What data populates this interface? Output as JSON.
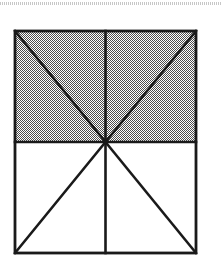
{
  "page": {
    "width": 221,
    "height": 275,
    "background_color": "#ffffff",
    "artifact": {
      "name": "scan-line-band",
      "y": 2,
      "height": 3,
      "color": "#787878"
    }
  },
  "figure": {
    "title": "Rectangle divided into eight triangles by two diagonals and a vertical median",
    "shape_type": "diagram",
    "stroke_color": "#1a1a1a",
    "stroke_width": 2.6,
    "fill_shaded": "#808080",
    "fill_plain": "#ffffff",
    "rect": {
      "left": 15,
      "top": 31,
      "right": 196,
      "bottom": 253,
      "width": 181,
      "height": 222
    },
    "center_point": {
      "x": 105.5,
      "y": 142,
      "label": "centre"
    },
    "corners": [
      {
        "name": "top-left",
        "x": 15,
        "y": 31
      },
      {
        "name": "top-right",
        "x": 196,
        "y": 31
      },
      {
        "name": "bottom-right",
        "x": 196,
        "y": 253
      },
      {
        "name": "bottom-left",
        "x": 15,
        "y": 253
      }
    ],
    "regions": [
      {
        "name": "upper-left-triangle",
        "shaded": true,
        "fill": "#808080"
      },
      {
        "name": "upper-right-triangle",
        "shaded": true,
        "fill": "#808080"
      },
      {
        "name": "left-upper-wedge",
        "shaded": true,
        "fill": "#808080"
      },
      {
        "name": "right-upper-wedge",
        "shaded": true,
        "fill": "#808080"
      },
      {
        "name": "lower-left-triangle",
        "shaded": false,
        "fill": "#ffffff"
      },
      {
        "name": "lower-right-triangle",
        "shaded": false,
        "fill": "#ffffff"
      },
      {
        "name": "left-lower-wedge",
        "shaded": false,
        "fill": "#ffffff"
      },
      {
        "name": "right-lower-wedge",
        "shaded": false,
        "fill": "#ffffff"
      }
    ],
    "segments": [
      {
        "name": "outline-top",
        "from": "top-left",
        "to": "top-right"
      },
      {
        "name": "outline-right",
        "from": "top-right",
        "to": "bottom-right"
      },
      {
        "name": "outline-bottom",
        "from": "bottom-right",
        "to": "bottom-left"
      },
      {
        "name": "outline-left",
        "from": "bottom-left",
        "to": "top-left"
      },
      {
        "name": "horizontal-median",
        "from": "left-mid",
        "to": "right-mid"
      },
      {
        "name": "vertical-median",
        "from": "top-mid",
        "to": "bottom-mid"
      },
      {
        "name": "diagonal-center-to-top-left",
        "from": "centre",
        "to": "top-left"
      },
      {
        "name": "diagonal-center-to-top-right",
        "from": "centre",
        "to": "top-right"
      },
      {
        "name": "diagonal-center-to-bottom-left",
        "from": "centre",
        "to": "bottom-left"
      },
      {
        "name": "diagonal-center-to-bottom-right",
        "from": "centre",
        "to": "bottom-right"
      }
    ]
  }
}
